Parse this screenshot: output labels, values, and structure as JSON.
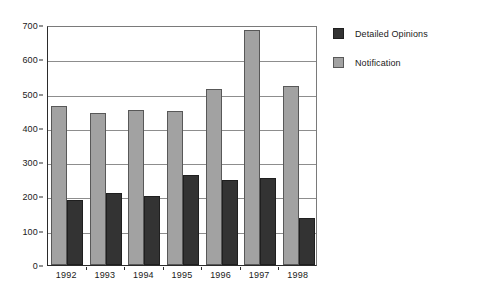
{
  "chart_data": {
    "type": "bar",
    "title": "",
    "xlabel": "",
    "ylabel": "",
    "categories": [
      "1992",
      "1993",
      "1994",
      "1995",
      "1996",
      "1997",
      "1998"
    ],
    "series": [
      {
        "name": "Detailed Opinions",
        "color": "#333333",
        "values": [
          190,
          211,
          202,
          264,
          249,
          255,
          137
        ]
      },
      {
        "name": "Notification",
        "color": "#a2a2a2",
        "values": [
          463,
          443,
          453,
          450,
          512,
          685,
          523
        ]
      }
    ],
    "ylim": [
      0,
      700
    ],
    "yticks": [
      0,
      100,
      200,
      300,
      400,
      500,
      600,
      700
    ],
    "ytick_labels": [
      "0",
      "100",
      "200",
      "300",
      "400",
      "500",
      "600",
      "700"
    ],
    "grid": true,
    "legend_position": "right"
  }
}
